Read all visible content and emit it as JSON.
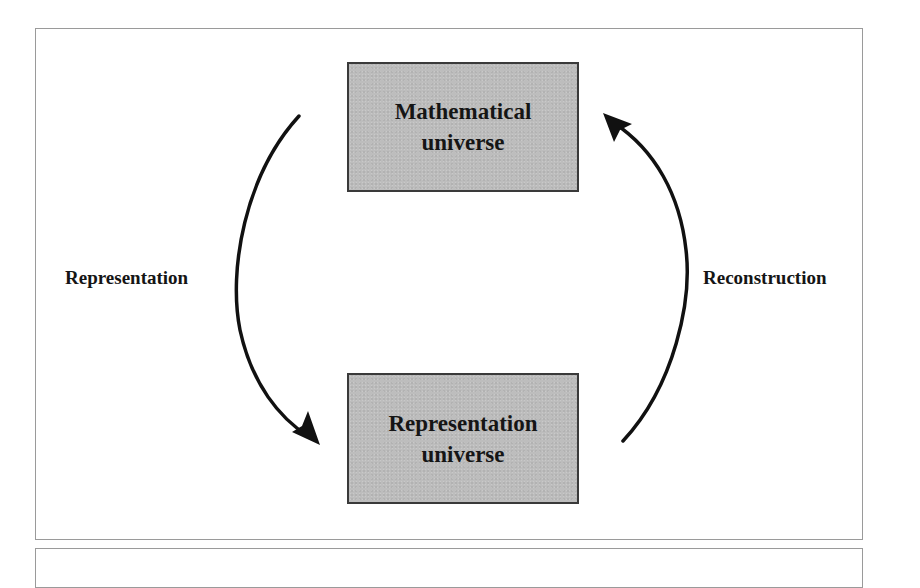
{
  "diagram": {
    "nodes": [
      {
        "id": "math",
        "line1": "Mathematical",
        "line2": "universe"
      },
      {
        "id": "rep",
        "line1": "Representation",
        "line2": "universe"
      }
    ],
    "edges": [
      {
        "from": "math",
        "to": "rep",
        "label": "Representation",
        "side": "left"
      },
      {
        "from": "rep",
        "to": "math",
        "label": "Reconstruction",
        "side": "right"
      }
    ],
    "colors": {
      "node_fill": "#bdbdbd",
      "node_border": "#3a3a3a",
      "arrow": "#111111",
      "frame_border": "#9a9a9a"
    }
  }
}
